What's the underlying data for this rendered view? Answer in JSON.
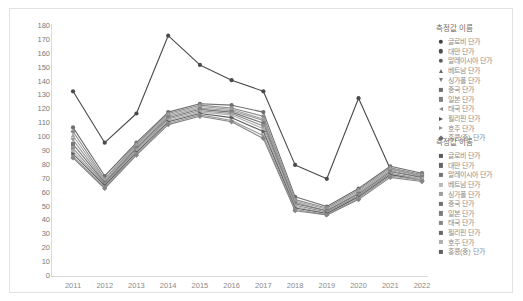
{
  "chart_data": {
    "type": "line",
    "title": "",
    "xlabel": "",
    "ylabel": "",
    "ylim": [
      0,
      180
    ],
    "ytick_step": 10,
    "grid": false,
    "legend_position": "right",
    "categories": [
      "2011",
      "2012",
      "2013",
      "2014",
      "2015",
      "2016",
      "2017",
      "2018",
      "2019",
      "2020",
      "2021",
      "2022"
    ],
    "yticks": [
      "180",
      "170",
      "160",
      "150",
      "140",
      "130",
      "120",
      "110",
      "100",
      "90",
      "80",
      "70",
      "60",
      "50",
      "40",
      "30",
      "20",
      "10",
      "0"
    ],
    "series": [
      {
        "name": "글로비 단가",
        "marker": "circle",
        "color": "#4a4a4a",
        "values": [
          133,
          96,
          117,
          173,
          152,
          141,
          133,
          80,
          70,
          128,
          77,
          72
        ]
      },
      {
        "name": "대만 단가",
        "marker": "circle",
        "color": "#6d6d6d",
        "values": [
          107,
          72,
          96,
          118,
          124,
          123,
          118,
          57,
          50,
          63,
          79,
          74
        ]
      },
      {
        "name": "말레이시아 단가",
        "marker": "circle",
        "color": "#8a8a8a",
        "values": [
          104,
          70,
          95,
          117,
          123,
          121,
          115,
          55,
          49,
          62,
          78,
          73
        ]
      },
      {
        "name": "베트남 단가",
        "marker": "tri",
        "color": "#a3a3a3",
        "values": [
          101,
          69,
          94,
          116,
          122,
          120,
          113,
          54,
          48,
          61,
          77,
          72
        ]
      },
      {
        "name": "싱가폴 단가",
        "marker": "tridown",
        "color": "#9a9a9a",
        "values": [
          98,
          68,
          93,
          115,
          121,
          119,
          112,
          53,
          47,
          60,
          76,
          71
        ]
      },
      {
        "name": "중국 단가",
        "marker": "square",
        "color": "#777777",
        "values": [
          95,
          67,
          92,
          114,
          120,
          118,
          110,
          52,
          47,
          59,
          75,
          71
        ]
      },
      {
        "name": "일본 단가",
        "marker": "square",
        "color": "#8f8f8f",
        "values": [
          92,
          66,
          91,
          113,
          119,
          117,
          108,
          51,
          46,
          58,
          74,
          70
        ]
      },
      {
        "name": "태국 단가",
        "marker": "trileft",
        "color": "#b0b0b0",
        "values": [
          90,
          65,
          90,
          112,
          118,
          116,
          106,
          50,
          45,
          57,
          73,
          70
        ]
      },
      {
        "name": "필리핀 단가",
        "marker": "triright",
        "color": "#5e5e5e",
        "values": [
          88,
          65,
          89,
          111,
          117,
          114,
          104,
          49,
          45,
          57,
          73,
          69
        ]
      },
      {
        "name": "호주 단가",
        "marker": "triright",
        "color": "#999999",
        "values": [
          86,
          64,
          88,
          110,
          116,
          112,
          101,
          48,
          44,
          56,
          72,
          69
        ]
      },
      {
        "name": "홍콩(중) 단가",
        "marker": "diamond",
        "color": "#858585",
        "values": [
          85,
          63,
          87,
          109,
          115,
          111,
          99,
          47,
          44,
          55,
          71,
          68
        ]
      }
    ]
  },
  "legend_top": {
    "title": "측정값 이름",
    "items": [
      {
        "label": "글로비 단가",
        "marker": "circle",
        "color": "#3f3f3f"
      },
      {
        "label": "대만 단가",
        "marker": "circle",
        "color": "#4f4f4f"
      },
      {
        "label": "말레이시아 단가",
        "marker": "circle",
        "color": "#5f5f5f"
      },
      {
        "label": "베트남 단가",
        "marker": "tri",
        "color": "#6b6b6b"
      },
      {
        "label": "싱가폴 단가",
        "marker": "tridown",
        "color": "#777777"
      },
      {
        "label": "중국 단가",
        "marker": "square",
        "color": "#6e6e6e"
      },
      {
        "label": "일본 단가",
        "marker": "square",
        "color": "#808080"
      },
      {
        "label": "태국 단가",
        "marker": "trileft",
        "color": "#8a8a8a"
      },
      {
        "label": "필리핀 단가",
        "marker": "triright",
        "color": "#545454"
      },
      {
        "label": "호주 단가",
        "marker": "triright",
        "color": "#919191"
      },
      {
        "label": "홍콩(중) 단가",
        "marker": "diamond",
        "color": "#6a6a6a"
      }
    ]
  },
  "legend_bottom": {
    "title": "측정값 이름",
    "items": [
      {
        "label": "글로비 단가",
        "marker": "square",
        "color": "#5a5a5a"
      },
      {
        "label": "대만 단가",
        "marker": "square",
        "color": "#656565"
      },
      {
        "label": "말레이시아 단가",
        "marker": "square",
        "color": "#737373"
      },
      {
        "label": "베트남 단가",
        "marker": "square",
        "color": "#b8b8b8"
      },
      {
        "label": "싱가폴 단가",
        "marker": "square",
        "color": "#9d9d9d"
      },
      {
        "label": "중국 단가",
        "marker": "square",
        "color": "#707070"
      },
      {
        "label": "일본 단가",
        "marker": "square",
        "color": "#7d7d7d"
      },
      {
        "label": "태국 단가",
        "marker": "square",
        "color": "#868686"
      },
      {
        "label": "필리핀 단가",
        "marker": "square",
        "color": "#666666"
      },
      {
        "label": "호주 단가",
        "marker": "square",
        "color": "#aeaeae"
      },
      {
        "label": "홍콩(중) 단가",
        "marker": "square",
        "color": "#5f5f5f"
      }
    ]
  }
}
